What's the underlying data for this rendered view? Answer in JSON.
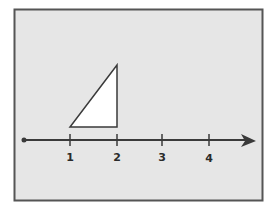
{
  "diagram": {
    "type": "number line with triangle",
    "colors": {
      "panel_background": "#e6e6e6",
      "panel_border": "#555555",
      "line": "#3a3a3a",
      "triangle_fill": "#ffffff"
    },
    "number_line": {
      "ticks": [
        {
          "value": "1",
          "x": 70
        },
        {
          "value": "2",
          "x": 117
        },
        {
          "value": "3",
          "x": 162
        },
        {
          "value": "4",
          "x": 209
        }
      ],
      "start_point": "dot",
      "end": "arrow"
    },
    "triangle": {
      "vertices": [
        [
          70,
          127
        ],
        [
          117,
          127
        ],
        [
          117,
          65
        ]
      ],
      "description": "right triangle spanning from 1 to 2 above the number line"
    }
  }
}
